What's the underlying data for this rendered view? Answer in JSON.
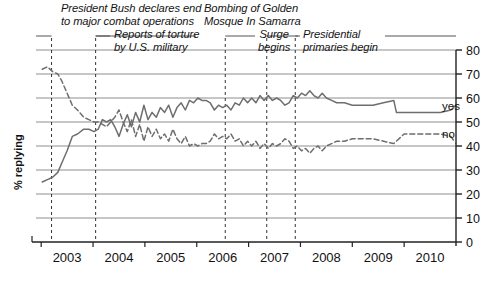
{
  "chart_data": {
    "type": "line",
    "title": "",
    "xlabel": "",
    "ylabel": "% replying",
    "ylim": [
      0,
      80
    ],
    "ytick_step": 10,
    "yticks": [
      0,
      10,
      20,
      30,
      40,
      50,
      60,
      70,
      80
    ],
    "xlim": [
      2002.5,
      2010.6
    ],
    "categories": [
      "2003",
      "2004",
      "2005",
      "2006",
      "2007",
      "2008",
      "2009",
      "2010"
    ],
    "grid": "horizontal",
    "legend_position": "inline-right",
    "series": [
      {
        "name": "yes",
        "style": "solid",
        "color": "#6e6e6e",
        "x": [
          2002.62,
          2002.72,
          2002.82,
          2002.92,
          2003.0,
          2003.1,
          2003.2,
          2003.3,
          2003.42,
          2003.52,
          2003.62,
          2003.7,
          2003.78,
          2003.86,
          2003.94,
          2004.02,
          2004.1,
          2004.18,
          2004.26,
          2004.34,
          2004.42,
          2004.5,
          2004.58,
          2004.66,
          2004.74,
          2004.82,
          2004.9,
          2004.98,
          2005.06,
          2005.14,
          2005.22,
          2005.3,
          2005.38,
          2005.46,
          2005.54,
          2005.62,
          2005.7,
          2005.78,
          2005.86,
          2005.94,
          2006.02,
          2006.1,
          2006.18,
          2006.26,
          2006.34,
          2006.42,
          2006.5,
          2006.58,
          2006.66,
          2006.74,
          2006.82,
          2006.9,
          2006.98,
          2007.06,
          2007.14,
          2007.22,
          2007.3,
          2007.38,
          2007.46,
          2007.54,
          2007.62,
          2007.7,
          2007.78,
          2007.86,
          2007.94,
          2008.02,
          2008.1,
          2008.2,
          2008.3,
          2008.45,
          2008.6,
          2008.8,
          2009.0,
          2009.2,
          2009.4,
          2009.45,
          2009.7,
          2010.0,
          2010.3,
          2010.5
        ],
        "values": [
          25,
          26,
          27,
          29,
          33,
          38,
          44,
          45,
          47,
          47,
          46,
          47,
          51,
          50,
          51,
          48,
          44,
          49,
          53,
          48,
          54,
          50,
          57,
          51,
          54,
          52,
          56,
          54,
          57,
          52,
          56,
          58,
          55,
          59,
          58,
          60,
          59,
          59,
          58,
          55,
          57,
          56,
          57,
          55,
          58,
          57,
          60,
          58,
          60,
          58,
          61,
          59,
          61,
          59,
          60,
          59,
          57,
          58,
          61,
          60,
          62,
          61,
          63,
          61,
          60,
          62,
          60,
          59,
          58,
          58,
          57,
          57,
          57,
          58,
          59,
          54,
          54,
          54,
          54,
          55
        ]
      },
      {
        "name": "no",
        "style": "dashed",
        "color": "#6e6e6e",
        "x": [
          2002.62,
          2002.72,
          2002.82,
          2002.92,
          2003.0,
          2003.1,
          2003.2,
          2003.3,
          2003.42,
          2003.52,
          2003.62,
          2003.7,
          2003.78,
          2003.86,
          2003.94,
          2004.02,
          2004.1,
          2004.18,
          2004.26,
          2004.34,
          2004.42,
          2004.5,
          2004.58,
          2004.66,
          2004.74,
          2004.82,
          2004.9,
          2004.98,
          2005.06,
          2005.14,
          2005.22,
          2005.3,
          2005.38,
          2005.46,
          2005.54,
          2005.62,
          2005.7,
          2005.78,
          2005.86,
          2005.94,
          2006.02,
          2006.1,
          2006.18,
          2006.26,
          2006.34,
          2006.42,
          2006.5,
          2006.58,
          2006.66,
          2006.74,
          2006.82,
          2006.9,
          2006.98,
          2007.06,
          2007.14,
          2007.22,
          2007.3,
          2007.38,
          2007.46,
          2007.54,
          2007.62,
          2007.7,
          2007.78,
          2007.86,
          2007.94,
          2008.02,
          2008.1,
          2008.2,
          2008.3,
          2008.45,
          2008.6,
          2008.8,
          2009.0,
          2009.2,
          2009.4,
          2009.6,
          2009.8,
          2010.0,
          2010.3,
          2010.5
        ],
        "values": [
          72,
          73,
          71,
          70,
          67,
          62,
          57,
          55,
          52,
          51,
          50,
          50,
          49,
          48,
          50,
          52,
          55,
          50,
          46,
          51,
          44,
          49,
          42,
          48,
          44,
          47,
          43,
          45,
          42,
          47,
          43,
          41,
          44,
          40,
          41,
          40,
          41,
          41,
          42,
          45,
          43,
          44,
          43,
          45,
          42,
          43,
          40,
          42,
          40,
          42,
          39,
          41,
          39,
          41,
          40,
          41,
          43,
          42,
          39,
          40,
          38,
          39,
          37,
          39,
          40,
          38,
          40,
          41,
          42,
          42,
          43,
          43,
          43,
          42,
          41,
          45,
          45,
          45,
          45,
          44
        ]
      }
    ],
    "annotations": [
      {
        "id": "bush-combat",
        "text": "President Bush declares end\nto major combat operations",
        "event_x": 2002.8
      },
      {
        "id": "torture-reports",
        "text": "Reports of torture\nby U.S. military",
        "event_x": 2003.65
      },
      {
        "id": "samarra-bombing",
        "text": "Bombing of Golden\nMosque In Samarra",
        "event_x": 2006.15
      },
      {
        "id": "surge-begins",
        "text": "Surge\nbegins",
        "event_x": 2006.95
      },
      {
        "id": "primaries-begin",
        "text": "Presidential\nprimaries begin",
        "event_x": 2007.5
      }
    ],
    "series_labels": [
      {
        "name": "yes",
        "value_at_label": 57
      },
      {
        "name": "no",
        "value_at_label": 47
      }
    ],
    "source_note": ""
  },
  "axis": {
    "y_title": "% replying",
    "y_ticks": [
      "0",
      "10",
      "20",
      "30",
      "40",
      "50",
      "60",
      "70",
      "80"
    ],
    "x_ticks": [
      "2003",
      "2004",
      "2005",
      "2006",
      "2007",
      "2008",
      "2009",
      "2010"
    ]
  },
  "annotations": {
    "bush_line1": "President Bush declares end",
    "bush_line2": "to major combat operations",
    "torture_line1": "Reports of torture",
    "torture_line2": "by U.S. military",
    "samarra_line1": "Bombing of Golden",
    "samarra_line2": "Mosque In Samarra",
    "surge_line1": "Surge",
    "surge_line2": "begins",
    "primaries_line1": "Presidential",
    "primaries_line2": "primaries begin"
  },
  "legend": {
    "yes": "yes",
    "no": "no"
  }
}
